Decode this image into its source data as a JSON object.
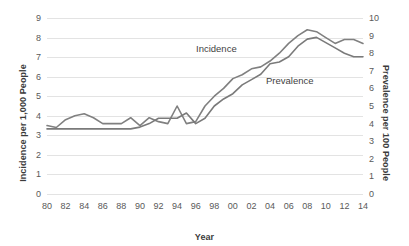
{
  "chart_data": {
    "type": "line",
    "title": "",
    "xlabel": "Year",
    "ylabel": "Incidence per 1,000 People",
    "y2label": "Prevalence per 100 People",
    "grid": true,
    "legend_position": "inline-annotation",
    "xlim": [
      1980,
      2014
    ],
    "ylim": [
      0,
      9
    ],
    "y2lim": [
      0,
      10
    ],
    "x_tick_labels": [
      "80",
      "82",
      "84",
      "86",
      "88",
      "90",
      "92",
      "94",
      "96",
      "98",
      "00",
      "02",
      "04",
      "06",
      "08",
      "10",
      "12",
      "14"
    ],
    "x_tick_values": [
      1980,
      1982,
      1984,
      1986,
      1988,
      1990,
      1992,
      1994,
      1996,
      1998,
      2000,
      2002,
      2004,
      2006,
      2008,
      2010,
      2012,
      2014
    ],
    "y_tick_labels": [
      "0",
      "1",
      "2",
      "3",
      "4",
      "5",
      "6",
      "7",
      "8",
      "9"
    ],
    "y2_tick_labels": [
      "0",
      "1",
      "2",
      "3",
      "4",
      "5",
      "6",
      "7",
      "8",
      "9",
      "10"
    ],
    "x": [
      1980,
      1981,
      1982,
      1983,
      1984,
      1985,
      1986,
      1987,
      1988,
      1989,
      1990,
      1991,
      1992,
      1993,
      1994,
      1995,
      1996,
      1997,
      1998,
      1999,
      2000,
      2001,
      2002,
      2003,
      2004,
      2005,
      2006,
      2007,
      2008,
      2009,
      2010,
      2011,
      2012,
      2013,
      2014
    ],
    "series": [
      {
        "name": "Incidence",
        "axis": "left",
        "color": "#808080",
        "values": [
          3.5,
          3.4,
          3.8,
          4.0,
          4.1,
          3.9,
          3.6,
          3.6,
          3.6,
          3.9,
          3.5,
          3.9,
          3.7,
          3.6,
          4.5,
          3.6,
          3.7,
          4.5,
          5.0,
          5.4,
          5.9,
          6.1,
          6.4,
          6.5,
          6.8,
          7.2,
          7.7,
          8.1,
          8.4,
          8.3,
          8.0,
          7.7,
          7.9,
          7.9,
          7.7
        ]
      },
      {
        "name": "Prevalence",
        "axis": "right",
        "color": "#7a7a7a",
        "values": [
          3.7,
          3.7,
          3.7,
          3.7,
          3.7,
          3.7,
          3.7,
          3.7,
          3.7,
          3.7,
          3.8,
          4.0,
          4.3,
          4.3,
          4.3,
          4.6,
          4.0,
          4.3,
          5.0,
          5.4,
          5.7,
          6.2,
          6.5,
          6.8,
          7.4,
          7.5,
          7.8,
          8.4,
          8.8,
          8.9,
          8.6,
          8.3,
          8.0,
          7.8,
          7.8
        ]
      }
    ],
    "annotations": [
      {
        "text": "Incidence",
        "series": "Incidence"
      },
      {
        "text": "Prevalence",
        "series": "Prevalence"
      }
    ]
  }
}
